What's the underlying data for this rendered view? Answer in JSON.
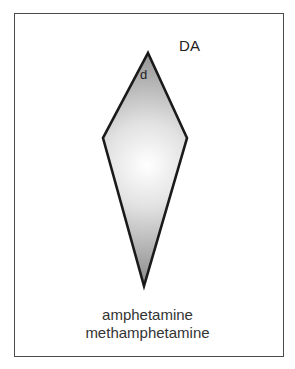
{
  "diagram": {
    "top_label": "DA",
    "vertex_label": "d",
    "bottom_labels": [
      "amphetamine",
      "methamphetamine"
    ],
    "shape": {
      "type": "kite",
      "vertices": {
        "top": [
          148,
          53
        ],
        "left": [
          103,
          138
        ],
        "right": [
          187,
          138
        ],
        "bottom": [
          144,
          286
        ]
      },
      "fill_gradient": {
        "center": "#ffffff",
        "edge": "#8f8f8f"
      },
      "stroke": "#1a1a1a"
    },
    "frame_color": "#4a4a4a"
  }
}
